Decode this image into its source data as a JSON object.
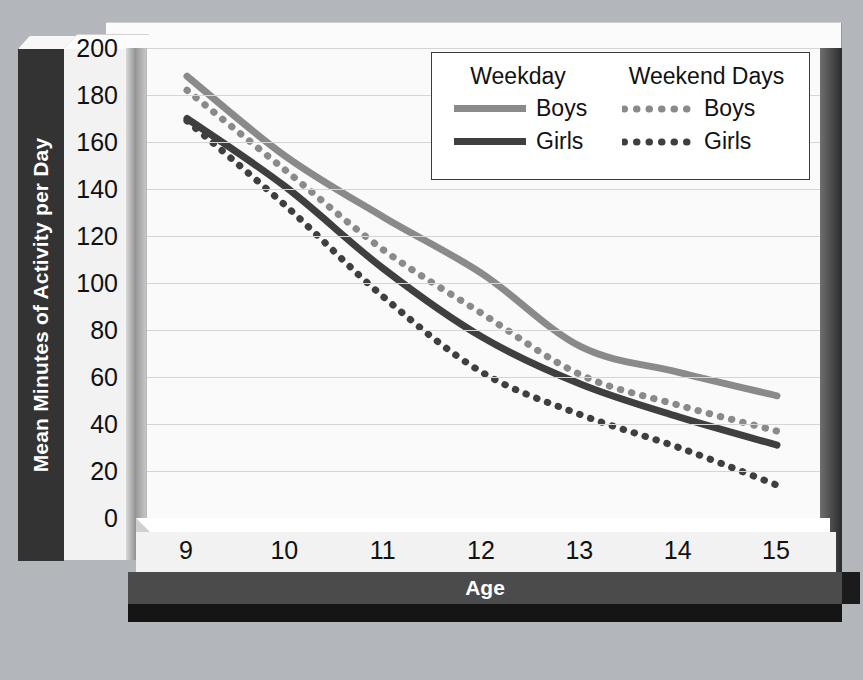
{
  "chart_data": {
    "type": "line",
    "title": "",
    "xlabel": "Age",
    "ylabel": "Mean Minutes of Activity per Day",
    "x": [
      9,
      10,
      11,
      12,
      13,
      14,
      15
    ],
    "xticklabels": [
      "9",
      "10",
      "11",
      "12",
      "13",
      "14",
      "15"
    ],
    "yticklabels": [
      "0",
      "20",
      "40",
      "60",
      "80",
      "100",
      "120",
      "140",
      "160",
      "180",
      "200"
    ],
    "yticks": [
      0,
      20,
      40,
      60,
      80,
      100,
      120,
      140,
      160,
      180,
      200
    ],
    "xlim": [
      9,
      15
    ],
    "ylim": [
      0,
      200
    ],
    "grid": true,
    "legend_position": "top-right",
    "series": [
      {
        "name": "Weekday Boys",
        "group": "Weekday",
        "label": "Boys",
        "style": "solid",
        "color": "#8a8a8a",
        "values": [
          188,
          154,
          128,
          104,
          73,
          62,
          52
        ]
      },
      {
        "name": "Weekday Girls",
        "group": "Weekday",
        "label": "Girls",
        "style": "solid",
        "color": "#3f3f3f",
        "values": [
          170,
          141,
          106,
          77,
          57,
          43,
          31
        ]
      },
      {
        "name": "Weekend Days Boys",
        "group": "Weekend Days",
        "label": "Boys",
        "style": "dotted",
        "color": "#8a8a8a",
        "values": [
          182,
          148,
          114,
          87,
          61,
          48,
          37
        ]
      },
      {
        "name": "Weekend Days Girls",
        "group": "Weekend Days",
        "label": "Girls",
        "style": "dotted",
        "color": "#3f3f3f",
        "values": [
          169,
          133,
          94,
          62,
          44,
          30,
          14
        ]
      }
    ]
  },
  "legend": {
    "headers": [
      "Weekday",
      "Weekend Days"
    ],
    "rows": [
      {
        "weekday_label": "Boys",
        "weekend_label": "Boys"
      },
      {
        "weekday_label": "Girls",
        "weekend_label": "Girls"
      }
    ]
  },
  "axes": {
    "y_title": "Mean Minutes of Activity per Day",
    "x_title": "Age"
  },
  "colors": {
    "boys": "#8a8a8a",
    "girls": "#3f3f3f",
    "background": "#b3b7bc",
    "plot_background": "#fafafa",
    "axis_bar": "#333333",
    "x_axis_bar": "#4b4b4b",
    "gridline": "#d5d5d5"
  }
}
